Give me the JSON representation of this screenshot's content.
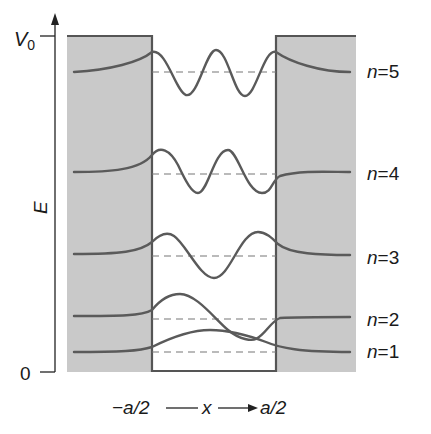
{
  "diagram": {
    "type": "finite square well wavefunctions",
    "y_axis": {
      "label": "E",
      "top_tick": "V",
      "top_tick_sub": "0",
      "bottom_tick": "0"
    },
    "x_axis": {
      "left": "−a/2",
      "var": "x",
      "right": "a/2"
    },
    "levels": [
      {
        "n": 5,
        "label_n": "n",
        "label_eq": "=5"
      },
      {
        "n": 4,
        "label_n": "n",
        "label_eq": "=4"
      },
      {
        "n": 3,
        "label_n": "n",
        "label_eq": "=3"
      },
      {
        "n": 2,
        "label_n": "n",
        "label_eq": "=2"
      },
      {
        "n": 1,
        "label_n": "n",
        "label_eq": "=1"
      }
    ],
    "colors": {
      "barrier": "#c9c9c9",
      "curve": "#5a5a5a",
      "dashed": "#777777",
      "text": "#1a1a1a"
    }
  }
}
